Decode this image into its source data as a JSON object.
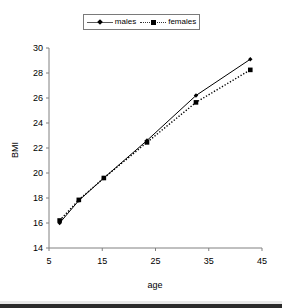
{
  "chart_data": {
    "type": "line",
    "title": "",
    "xlabel": "age",
    "ylabel": "BMI",
    "xlim": [
      5,
      45
    ],
    "ylim": [
      14,
      30
    ],
    "xticks": [
      5,
      15,
      25,
      35,
      45
    ],
    "yticks": [
      14,
      16,
      18,
      20,
      22,
      24,
      26,
      28,
      30
    ],
    "grid": false,
    "legend_position": "top-center",
    "x": [
      7.0,
      10.6,
      15.3,
      23.4,
      32.6,
      42.8
    ],
    "series": [
      {
        "name": "males",
        "values": [
          16.0,
          17.8,
          19.6,
          22.6,
          26.2,
          29.1
        ],
        "line_style": "solid",
        "marker": "diamond",
        "color": "#000000"
      },
      {
        "name": "females",
        "values": [
          16.2,
          17.85,
          19.6,
          22.45,
          25.65,
          28.25
        ],
        "line_style": "dotted",
        "marker": "square",
        "color": "#000000"
      }
    ]
  },
  "legend": {
    "entries": [
      {
        "label": "males",
        "marker_icon": "diamond-marker-icon",
        "line_icon": "solid-line-icon"
      },
      {
        "label": "females",
        "marker_icon": "square-marker-icon",
        "line_icon": "dotted-line-icon"
      }
    ]
  },
  "axes": {
    "y_title": "BMI",
    "x_title": "age",
    "y_tick_labels": [
      "30",
      "28",
      "26",
      "24",
      "22",
      "20",
      "18",
      "16",
      "14"
    ],
    "x_tick_labels": [
      "5",
      "15",
      "25",
      "35",
      "45"
    ]
  },
  "colors": {
    "axis": "#808080",
    "series_males": "#000000",
    "series_females": "#000000",
    "legend_border": "#7a7a7a",
    "background": "#ffffff"
  }
}
